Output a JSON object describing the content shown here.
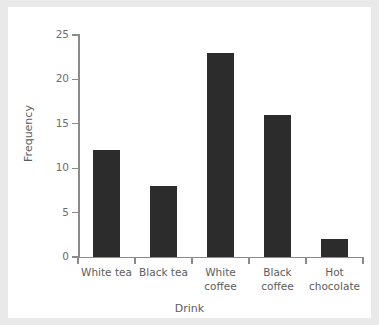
{
  "chart_data": {
    "type": "bar",
    "title": "",
    "subtitle": "",
    "xlabel": "Drink",
    "ylabel": "Frequency",
    "categories": [
      "White tea",
      "Black tea",
      "White coffee",
      "Black coffee",
      "Hot chocolate"
    ],
    "values": [
      12,
      8,
      23,
      16,
      2
    ],
    "ylim": [
      0,
      25
    ],
    "y_ticks": [
      0,
      5,
      10,
      15,
      20,
      25
    ],
    "y_tick_labels": [
      "0",
      "5",
      "10",
      "15",
      "20",
      "25"
    ],
    "grid": false,
    "legend": null,
    "legend_position": "none",
    "bar_color": "#2c2c2c",
    "axis_color": "#8a8a8a",
    "label_color": "#5d5d5d",
    "background_color": "#ffffff",
    "page_background_color": "#e9e9e9"
  },
  "axes": {
    "x_title": "Drink",
    "y_title": "Frequency"
  },
  "category_labels": [
    {
      "line1": "White tea",
      "line2": ""
    },
    {
      "line1": "Black tea",
      "line2": ""
    },
    {
      "line1": "White",
      "line2": "coffee"
    },
    {
      "line1": "Black",
      "line2": "coffee"
    },
    {
      "line1": "Hot",
      "line2": "chocolate"
    }
  ]
}
